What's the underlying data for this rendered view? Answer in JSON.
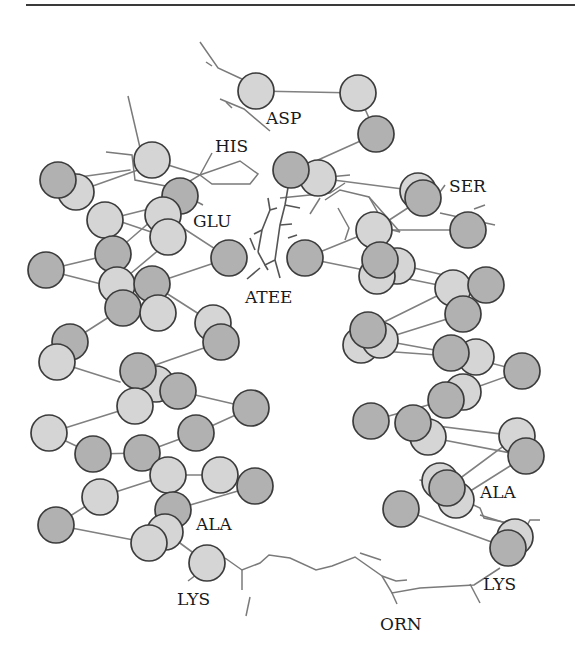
{
  "figure": {
    "title": "",
    "colors": {
      "dark_atom": "#b1b1b1",
      "light_atom": "#d5d5d5",
      "atom_outline": "#3c3c3c",
      "bond": "#808080",
      "ligand": "#555555",
      "label": "#1a1a1a"
    },
    "atom_radius": 18,
    "labels": [
      {
        "id": "asp",
        "text": "ASP",
        "x": 266,
        "y": 124
      },
      {
        "id": "his",
        "text": "HIS",
        "x": 215,
        "y": 152
      },
      {
        "id": "ser",
        "text": "SER",
        "x": 449,
        "y": 192
      },
      {
        "id": "glu",
        "text": "GLU",
        "x": 193,
        "y": 227
      },
      {
        "id": "atee",
        "text": "ATEE",
        "x": 245,
        "y": 303
      },
      {
        "id": "ala-left",
        "text": "ALA",
        "x": 196,
        "y": 530
      },
      {
        "id": "ala-right",
        "text": "ALA",
        "x": 480,
        "y": 498
      },
      {
        "id": "lys-left",
        "text": "LYS",
        "x": 177,
        "y": 605
      },
      {
        "id": "lys-right",
        "text": "LYS",
        "x": 483,
        "y": 590
      },
      {
        "id": "orn",
        "text": "ORN",
        "x": 380,
        "y": 630
      }
    ],
    "atoms": [
      {
        "x": 76,
        "y": 192,
        "t": "light"
      },
      {
        "x": 58,
        "y": 180,
        "t": "dark"
      },
      {
        "x": 152,
        "y": 160,
        "t": "light"
      },
      {
        "x": 180,
        "y": 196,
        "t": "dark"
      },
      {
        "x": 163,
        "y": 215,
        "t": "light"
      },
      {
        "x": 105,
        "y": 220,
        "t": "light"
      },
      {
        "x": 168,
        "y": 237,
        "t": "light"
      },
      {
        "x": 113,
        "y": 254,
        "t": "dark"
      },
      {
        "x": 46,
        "y": 270,
        "t": "dark"
      },
      {
        "x": 229,
        "y": 258,
        "t": "dark"
      },
      {
        "x": 117,
        "y": 285,
        "t": "light"
      },
      {
        "x": 152,
        "y": 284,
        "t": "dark"
      },
      {
        "x": 123,
        "y": 308,
        "t": "dark"
      },
      {
        "x": 158,
        "y": 313,
        "t": "light"
      },
      {
        "x": 213,
        "y": 323,
        "t": "light"
      },
      {
        "x": 221,
        "y": 342,
        "t": "dark"
      },
      {
        "x": 70,
        "y": 342,
        "t": "dark"
      },
      {
        "x": 57,
        "y": 362,
        "t": "light"
      },
      {
        "x": 156,
        "y": 384,
        "t": "light"
      },
      {
        "x": 138,
        "y": 371,
        "t": "dark"
      },
      {
        "x": 178,
        "y": 391,
        "t": "dark"
      },
      {
        "x": 251,
        "y": 408,
        "t": "dark"
      },
      {
        "x": 135,
        "y": 406,
        "t": "light"
      },
      {
        "x": 49,
        "y": 433,
        "t": "light"
      },
      {
        "x": 196,
        "y": 433,
        "t": "dark"
      },
      {
        "x": 93,
        "y": 454,
        "t": "dark"
      },
      {
        "x": 142,
        "y": 453,
        "t": "dark"
      },
      {
        "x": 168,
        "y": 475,
        "t": "light"
      },
      {
        "x": 220,
        "y": 475,
        "t": "light"
      },
      {
        "x": 255,
        "y": 486,
        "t": "dark"
      },
      {
        "x": 100,
        "y": 497,
        "t": "light"
      },
      {
        "x": 173,
        "y": 510,
        "t": "dark"
      },
      {
        "x": 165,
        "y": 532,
        "t": "light"
      },
      {
        "x": 56,
        "y": 525,
        "t": "dark"
      },
      {
        "x": 149,
        "y": 543,
        "t": "light"
      },
      {
        "x": 207,
        "y": 563,
        "t": "light"
      },
      {
        "x": 256,
        "y": 91,
        "t": "light"
      },
      {
        "x": 358,
        "y": 93,
        "t": "light"
      },
      {
        "x": 376,
        "y": 134,
        "t": "dark"
      },
      {
        "x": 318,
        "y": 178,
        "t": "light"
      },
      {
        "x": 291,
        "y": 170,
        "t": "dark"
      },
      {
        "x": 418,
        "y": 191,
        "t": "light"
      },
      {
        "x": 423,
        "y": 198,
        "t": "dark"
      },
      {
        "x": 468,
        "y": 230,
        "t": "dark"
      },
      {
        "x": 374,
        "y": 230,
        "t": "light"
      },
      {
        "x": 305,
        "y": 258,
        "t": "dark"
      },
      {
        "x": 397,
        "y": 266,
        "t": "light"
      },
      {
        "x": 377,
        "y": 276,
        "t": "light"
      },
      {
        "x": 380,
        "y": 260,
        "t": "dark"
      },
      {
        "x": 453,
        "y": 288,
        "t": "light"
      },
      {
        "x": 486,
        "y": 285,
        "t": "dark"
      },
      {
        "x": 463,
        "y": 314,
        "t": "dark"
      },
      {
        "x": 361,
        "y": 345,
        "t": "light"
      },
      {
        "x": 380,
        "y": 340,
        "t": "light"
      },
      {
        "x": 368,
        "y": 330,
        "t": "dark"
      },
      {
        "x": 476,
        "y": 357,
        "t": "light"
      },
      {
        "x": 451,
        "y": 353,
        "t": "dark"
      },
      {
        "x": 522,
        "y": 371,
        "t": "dark"
      },
      {
        "x": 463,
        "y": 392,
        "t": "light"
      },
      {
        "x": 446,
        "y": 400,
        "t": "dark"
      },
      {
        "x": 371,
        "y": 421,
        "t": "dark"
      },
      {
        "x": 428,
        "y": 437,
        "t": "light"
      },
      {
        "x": 413,
        "y": 423,
        "t": "dark"
      },
      {
        "x": 517,
        "y": 436,
        "t": "light"
      },
      {
        "x": 526,
        "y": 456,
        "t": "dark"
      },
      {
        "x": 440,
        "y": 481,
        "t": "light"
      },
      {
        "x": 456,
        "y": 500,
        "t": "light"
      },
      {
        "x": 447,
        "y": 488,
        "t": "dark"
      },
      {
        "x": 401,
        "y": 509,
        "t": "dark"
      },
      {
        "x": 515,
        "y": 537,
        "t": "light"
      },
      {
        "x": 508,
        "y": 548,
        "t": "dark"
      }
    ],
    "bonds": [
      [
        76,
        192,
        152,
        165
      ],
      [
        58,
        180,
        130,
        170
      ],
      [
        105,
        220,
        185,
        200
      ],
      [
        92,
        212,
        166,
        237
      ],
      [
        163,
        215,
        229,
        258
      ],
      [
        113,
        254,
        180,
        196
      ],
      [
        46,
        270,
        113,
        254
      ],
      [
        117,
        285,
        173,
        238
      ],
      [
        46,
        270,
        105,
        285
      ],
      [
        152,
        284,
        229,
        258
      ],
      [
        213,
        323,
        152,
        284
      ],
      [
        70,
        342,
        123,
        308
      ],
      [
        57,
        362,
        120,
        382
      ],
      [
        138,
        371,
        221,
        342
      ],
      [
        178,
        391,
        251,
        408
      ],
      [
        49,
        433,
        135,
        406
      ],
      [
        93,
        454,
        49,
        433
      ],
      [
        142,
        453,
        93,
        454
      ],
      [
        196,
        433,
        142,
        453
      ],
      [
        251,
        408,
        196,
        433
      ],
      [
        168,
        475,
        220,
        475
      ],
      [
        100,
        497,
        168,
        475
      ],
      [
        56,
        525,
        100,
        497
      ],
      [
        56,
        525,
        149,
        543
      ],
      [
        173,
        510,
        255,
        486
      ],
      [
        165,
        532,
        207,
        563
      ],
      [
        256,
        91,
        358,
        93
      ],
      [
        358,
        93,
        376,
        134
      ],
      [
        376,
        134,
        318,
        160
      ],
      [
        318,
        178,
        418,
        191
      ],
      [
        423,
        198,
        374,
        230
      ],
      [
        374,
        230,
        468,
        230
      ],
      [
        305,
        258,
        374,
        230
      ],
      [
        305,
        258,
        453,
        288
      ],
      [
        380,
        260,
        486,
        285
      ],
      [
        368,
        330,
        453,
        288
      ],
      [
        380,
        340,
        463,
        314
      ],
      [
        380,
        340,
        451,
        353
      ],
      [
        367,
        350,
        451,
        356
      ],
      [
        463,
        392,
        522,
        371
      ],
      [
        451,
        353,
        522,
        371
      ],
      [
        371,
        421,
        446,
        400
      ],
      [
        413,
        423,
        517,
        436
      ],
      [
        428,
        437,
        526,
        456
      ],
      [
        447,
        488,
        517,
        436
      ],
      [
        456,
        500,
        526,
        456
      ],
      [
        401,
        509,
        508,
        548
      ],
      [
        420,
        480,
        447,
        488
      ]
    ],
    "sidechains": [
      "M200,42 L218,68 L244,80 L256,91",
      "M206,62 L212,66",
      "M220,99 L244,109 L270,131",
      "M226,102 L232,108",
      "M128,96 L141,152",
      "M106,152 L132,155 L135,180 L171,187 L190,198 L203,205",
      "M172,192 L200,175 L212,153",
      "M152,160 L200,175",
      "M200,175 L240,161 L258,174 L250,184 L212,184 Z",
      "M180,196 L195,202",
      "M318,178 L350,175",
      "M325,200 L340,190 L369,197 L377,211 L380,227 L400,232",
      "M310,175 L320,180",
      "M280,198 L330,193 L345,183",
      "M338,208 L349,228 L345,240",
      "M320,198 L310,214",
      "M369,197 L400,232",
      "M440,192 L445,185",
      "M440,213 L495,225",
      "M474,209 L485,205",
      "M463,500 L480,508 L484,518 L522,526",
      "M480,515 L525,529 L530,520 L540,520",
      "M500,540 L512,535 L520,530",
      "M195,564 L210,568",
      "M225,558 L242,570 L260,563 L269,555 L290,558 L316,570 L332,566 L355,557 L382,576 L392,593 L420,588 L474,585 L500,568",
      "M242,570 L242,590",
      "M392,593 L397,604",
      "M382,576 L396,581 L407,580",
      "M470,584 L480,603",
      "M250,597 L246,616",
      "M188,581 L196,575",
      "M360,553 L381,560"
    ],
    "ligand_path": [
      "M291,170 L285,205 L280,225 L275,260 L265,265 L258,252",
      "M258,252 L262,230 L270,210",
      "M262,230 L254,234",
      "M270,210 L268,198",
      "M285,205 L300,208",
      "M275,260 L280,278",
      "M280,225 L292,224",
      "M270,210 L277,208",
      "M250,238 L255,250",
      "M260,268 L247,279",
      "M265,265 L268,270",
      "M288,238 L297,235"
    ]
  }
}
